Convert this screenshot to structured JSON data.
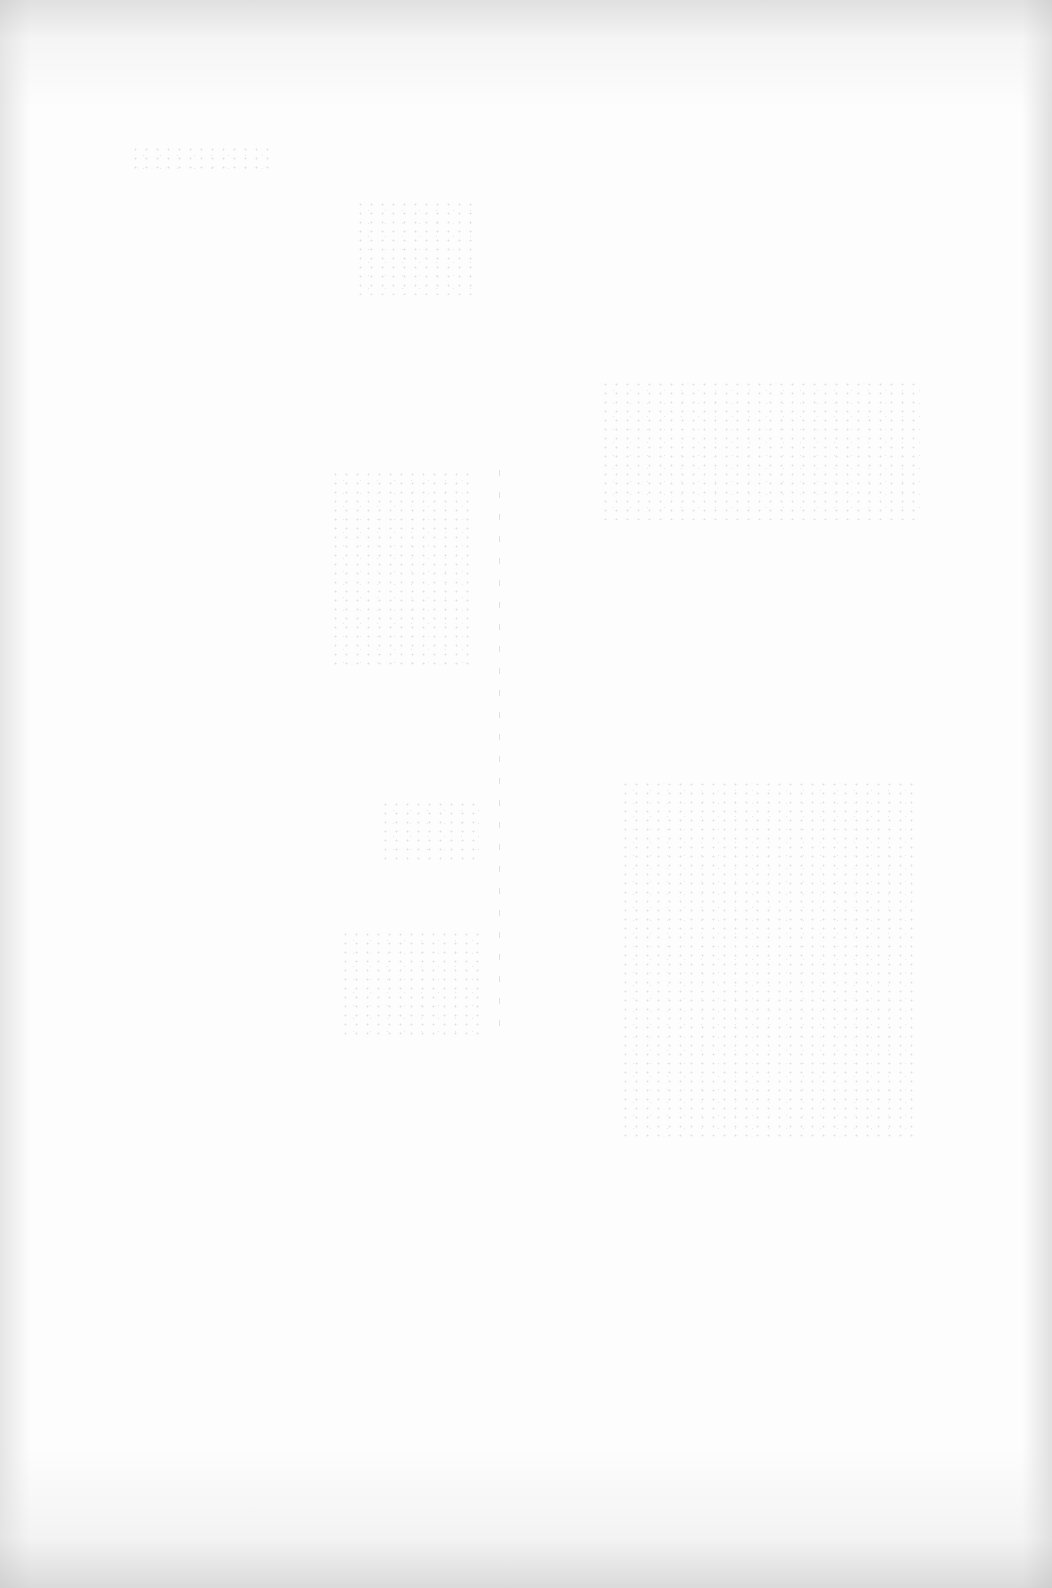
{
  "page": {
    "type": "scanned-page",
    "content": "blank",
    "background_color": "#fdfdfd",
    "edge_shade_color": "#c8c8c8",
    "fold_line_x": 499,
    "notes_visible": false
  }
}
